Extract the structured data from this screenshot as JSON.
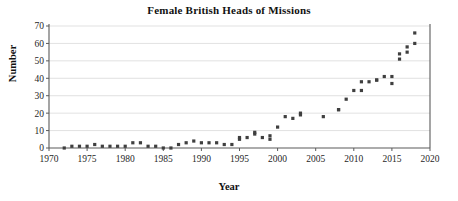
{
  "chart_data": {
    "type": "scatter",
    "title": "Female British Heads of Missions",
    "xlabel": "Year",
    "ylabel": "Number",
    "xlim": [
      1970,
      2020
    ],
    "ylim": [
      0,
      70
    ],
    "xticks": [
      1970,
      1975,
      1980,
      1985,
      1990,
      1995,
      2000,
      2005,
      2010,
      2015,
      2020
    ],
    "yticks": [
      0,
      10,
      20,
      30,
      40,
      50,
      60,
      70
    ],
    "grid": "horizontal",
    "legend": null,
    "marker": "square",
    "marker_color": "#3f3f3f",
    "series": [
      {
        "name": "Female British Heads of Missions",
        "x": [
          1972,
          1973,
          1974,
          1975,
          1976,
          1977,
          1978,
          1979,
          1980,
          1981,
          1982,
          1983,
          1984,
          1985,
          1986,
          1987,
          1988,
          1989,
          1990,
          1991,
          1992,
          1993,
          1994,
          1995,
          1996,
          1997,
          1998,
          1999,
          2000,
          2001,
          2002,
          2003,
          2006,
          2008,
          2009,
          2010,
          2011,
          2012,
          2013,
          2014,
          2015,
          2016,
          2017,
          2018
        ],
        "values": [
          0,
          1,
          1,
          1,
          2,
          1,
          1,
          1,
          1,
          3,
          3,
          1,
          1,
          0,
          0,
          2,
          3,
          4,
          3,
          3,
          3,
          2,
          2,
          6,
          6,
          8,
          6,
          5,
          12,
          18,
          17,
          20,
          18,
          22,
          28,
          33,
          33,
          38,
          39,
          41,
          41,
          54,
          55,
          66
        ]
      },
      {
        "name": "Female British Heads of Missions (secondary readings)",
        "x": [
          1995,
          1997,
          1999,
          2003,
          2008,
          2011,
          2013,
          2015,
          2016,
          2017,
          2018
        ],
        "values": [
          5,
          9,
          7,
          19,
          22,
          38,
          39,
          37,
          51,
          58,
          60
        ]
      }
    ]
  }
}
